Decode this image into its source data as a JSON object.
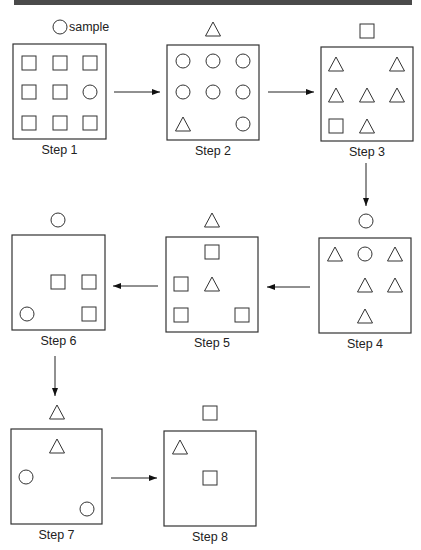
{
  "header": {
    "bar_color": "#4a4a4a"
  },
  "legend": {
    "symbol": "circle",
    "label": "sample"
  },
  "steps": [
    {
      "label": "Step 1",
      "above": null,
      "box": {
        "x": 13,
        "y": 44,
        "w": 93,
        "h": 95
      },
      "items": [
        {
          "shape": "square",
          "cx": 29,
          "cy": 63
        },
        {
          "shape": "square",
          "cx": 60,
          "cy": 63
        },
        {
          "shape": "square",
          "cx": 90,
          "cy": 63
        },
        {
          "shape": "square",
          "cx": 29,
          "cy": 92
        },
        {
          "shape": "square",
          "cx": 60,
          "cy": 92
        },
        {
          "shape": "circle",
          "cx": 90,
          "cy": 92
        },
        {
          "shape": "square",
          "cx": 29,
          "cy": 123
        },
        {
          "shape": "square",
          "cx": 60,
          "cy": 123
        },
        {
          "shape": "square",
          "cx": 90,
          "cy": 123
        }
      ]
    },
    {
      "label": "Step 2",
      "above": {
        "shape": "triangle",
        "cx": 213,
        "cy": 29
      },
      "box": {
        "x": 167,
        "y": 45,
        "w": 92,
        "h": 95
      },
      "items": [
        {
          "shape": "circle",
          "cx": 183,
          "cy": 61
        },
        {
          "shape": "circle",
          "cx": 213,
          "cy": 61
        },
        {
          "shape": "circle",
          "cx": 243,
          "cy": 61
        },
        {
          "shape": "circle",
          "cx": 183,
          "cy": 92
        },
        {
          "shape": "circle",
          "cx": 213,
          "cy": 92
        },
        {
          "shape": "circle",
          "cx": 243,
          "cy": 92
        },
        {
          "shape": "triangle",
          "cx": 183,
          "cy": 124
        },
        {
          "shape": "circle",
          "cx": 243,
          "cy": 124
        }
      ]
    },
    {
      "label": "Step 3",
      "above": {
        "shape": "square",
        "cx": 367,
        "cy": 31
      },
      "box": {
        "x": 321,
        "y": 47,
        "w": 92,
        "h": 94
      },
      "items": [
        {
          "shape": "triangle",
          "cx": 336,
          "cy": 64
        },
        {
          "shape": "triangle",
          "cx": 397,
          "cy": 64
        },
        {
          "shape": "triangle",
          "cx": 336,
          "cy": 95
        },
        {
          "shape": "triangle",
          "cx": 367,
          "cy": 95
        },
        {
          "shape": "triangle",
          "cx": 397,
          "cy": 95
        },
        {
          "shape": "square",
          "cx": 336,
          "cy": 126
        },
        {
          "shape": "triangle",
          "cx": 367,
          "cy": 126
        }
      ]
    },
    {
      "label": "Step 4",
      "above": {
        "shape": "circle",
        "cx": 366,
        "cy": 221
      },
      "box": {
        "x": 319,
        "y": 238,
        "w": 92,
        "h": 95
      },
      "items": [
        {
          "shape": "triangle",
          "cx": 335,
          "cy": 254
        },
        {
          "shape": "circle",
          "cx": 365,
          "cy": 254
        },
        {
          "shape": "triangle",
          "cx": 395,
          "cy": 254
        },
        {
          "shape": "triangle",
          "cx": 365,
          "cy": 285
        },
        {
          "shape": "triangle",
          "cx": 395,
          "cy": 285
        },
        {
          "shape": "triangle",
          "cx": 365,
          "cy": 316
        }
      ]
    },
    {
      "label": "Step 5",
      "above": {
        "shape": "triangle",
        "cx": 212,
        "cy": 220
      },
      "box": {
        "x": 166,
        "y": 237,
        "w": 92,
        "h": 95
      },
      "items": [
        {
          "shape": "square",
          "cx": 212,
          "cy": 252
        },
        {
          "shape": "square",
          "cx": 181,
          "cy": 284
        },
        {
          "shape": "triangle",
          "cx": 212,
          "cy": 284
        },
        {
          "shape": "square",
          "cx": 181,
          "cy": 315
        },
        {
          "shape": "square",
          "cx": 242,
          "cy": 315
        }
      ]
    },
    {
      "label": "Step 6",
      "above": {
        "shape": "circle",
        "cx": 58,
        "cy": 220
      },
      "box": {
        "x": 12,
        "y": 235,
        "w": 93,
        "h": 95
      },
      "items": [
        {
          "shape": "square",
          "cx": 58,
          "cy": 282
        },
        {
          "shape": "square",
          "cx": 89,
          "cy": 282
        },
        {
          "shape": "circle",
          "cx": 27,
          "cy": 314
        },
        {
          "shape": "square",
          "cx": 89,
          "cy": 314
        }
      ]
    },
    {
      "label": "Step 7",
      "above": {
        "shape": "triangle",
        "cx": 57,
        "cy": 412
      },
      "box": {
        "x": 11,
        "y": 429,
        "w": 91,
        "h": 95
      },
      "items": [
        {
          "shape": "triangle",
          "cx": 57,
          "cy": 446
        },
        {
          "shape": "circle",
          "cx": 26,
          "cy": 477
        },
        {
          "shape": "circle",
          "cx": 87,
          "cy": 509
        }
      ]
    },
    {
      "label": "Step 8",
      "above": {
        "shape": "square",
        "cx": 210,
        "cy": 413
      },
      "box": {
        "x": 164,
        "y": 431,
        "w": 92,
        "h": 95
      },
      "items": [
        {
          "shape": "triangle",
          "cx": 180,
          "cy": 447
        },
        {
          "shape": "square",
          "cx": 210,
          "cy": 478
        }
      ]
    }
  ],
  "arrows": [
    {
      "from": "Step 1",
      "to": "Step 2",
      "x1": 114,
      "y1": 92,
      "x2": 160,
      "y2": 92
    },
    {
      "from": "Step 2",
      "to": "Step 3",
      "x1": 268,
      "y1": 92,
      "x2": 314,
      "y2": 92
    },
    {
      "from": "Step 3",
      "to": "Step 4",
      "x1": 366,
      "y1": 163,
      "x2": 366,
      "y2": 206
    },
    {
      "from": "Step 4",
      "to": "Step 5",
      "x1": 310,
      "y1": 287,
      "x2": 267,
      "y2": 287
    },
    {
      "from": "Step 5",
      "to": "Step 6",
      "x1": 158,
      "y1": 286,
      "x2": 113,
      "y2": 286
    },
    {
      "from": "Step 6",
      "to": "Step 7",
      "x1": 55,
      "y1": 356,
      "x2": 55,
      "y2": 396
    },
    {
      "from": "Step 7",
      "to": "Step 8",
      "x1": 111,
      "y1": 478,
      "x2": 157,
      "y2": 478
    }
  ]
}
